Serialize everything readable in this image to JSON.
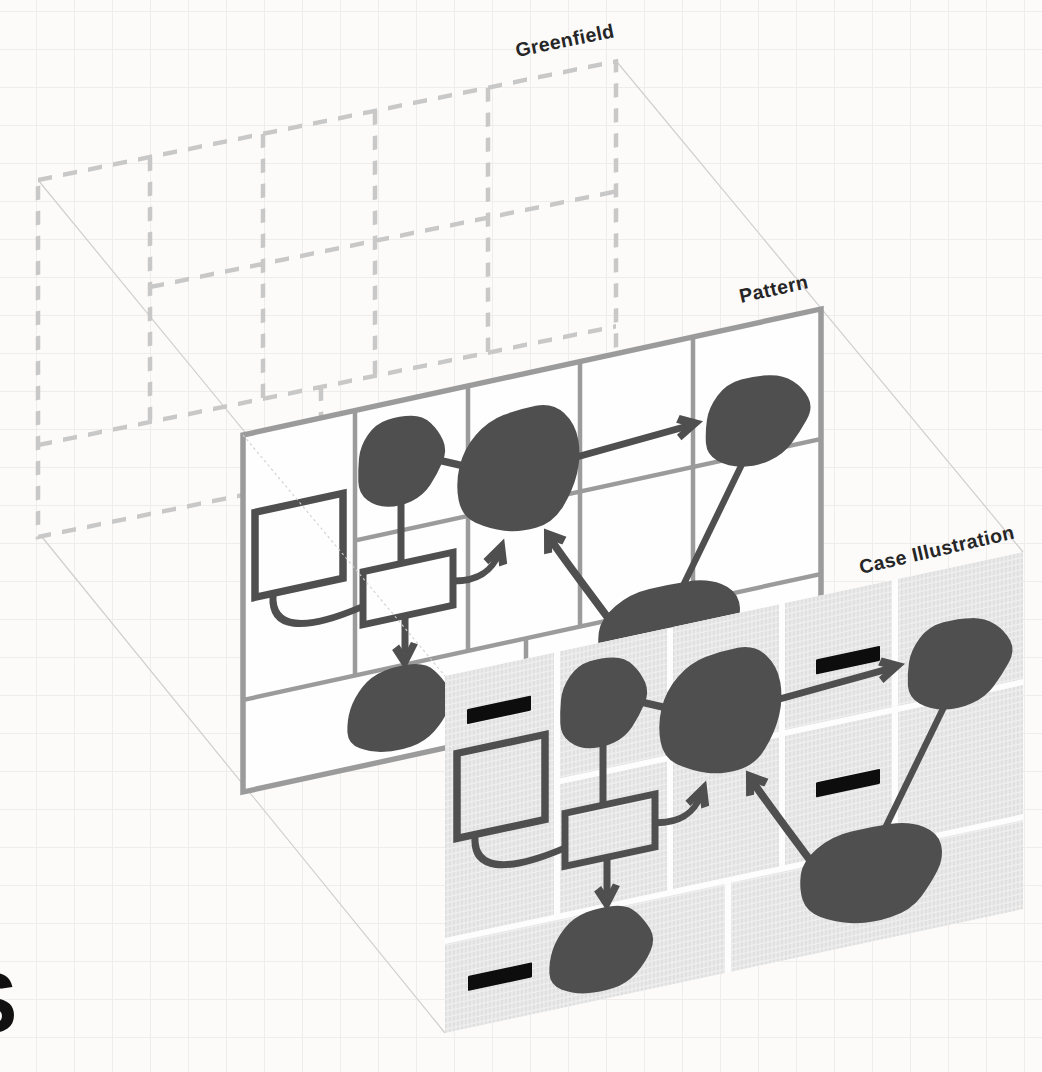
{
  "diagram": {
    "layers": [
      {
        "id": "greenfield",
        "label": "Greenfield",
        "style": "dashed-empty-grid"
      },
      {
        "id": "pattern",
        "label": "Pattern",
        "style": "solid-grid-with-shapes"
      },
      {
        "id": "case-illustration",
        "label": "Case Illustration",
        "style": "hatched-cells-with-shapes-and-redactions"
      }
    ],
    "cropped_page_letter": "S"
  },
  "colors": {
    "background": "#fcfbfa",
    "page_grid": "#efedeb",
    "greenfield_dash": "#c8c8c8",
    "pattern_grid": "#9b9b9b",
    "pattern_fill": "#fefefe",
    "ink": "#4f4f4f",
    "hatch_cell": "#e9e9e9",
    "hatch_stripe": "#dedede",
    "projection_line": "#cfcfcf",
    "redaction_black": "#0d0d0d",
    "label_text": "#262626"
  }
}
